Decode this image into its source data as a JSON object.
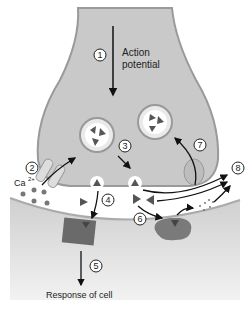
{
  "diagram": {
    "steps": [
      {
        "number": "1",
        "label": "Action potential"
      },
      {
        "number": "2",
        "label": "Ca²⁺ influx"
      },
      {
        "number": "3",
        "label": "Vesicle fusion"
      },
      {
        "number": "4",
        "label": "Neurotransmitter binds receptor"
      },
      {
        "number": "5",
        "label": "Response of cell"
      },
      {
        "number": "6",
        "label": "Enzymatic degradation"
      },
      {
        "number": "7",
        "label": "Reuptake"
      },
      {
        "number": "8",
        "label": "Diffusion away"
      }
    ],
    "labels": {
      "action_line1": "Action",
      "action_line2": "potential",
      "ca": "Ca",
      "ca_sup": "2+",
      "response": "Response of cell"
    },
    "colors": {
      "presynaptic_fill": "#c9c9c9",
      "presynaptic_edge": "#9a9a9a",
      "postsynaptic_fill": "#d8d8d8",
      "receptor": "#6a6a6a",
      "enzyme": "#7a7a7a",
      "transmitter": "#555555",
      "arrow": "#111111"
    }
  }
}
